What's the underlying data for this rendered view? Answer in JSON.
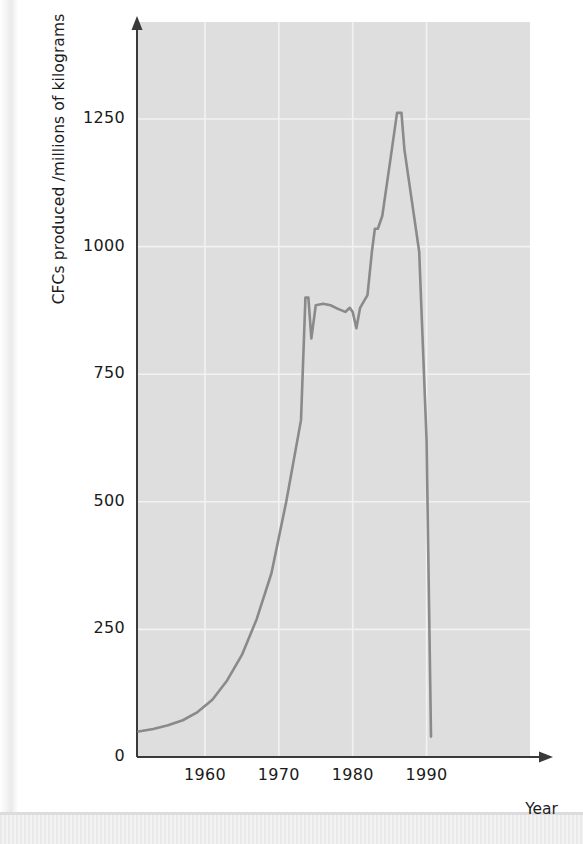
{
  "figure": {
    "background_color": "#ffffff",
    "plot_background_color": "#dededf",
    "gridline_color": "#f2f2f2",
    "line_color": "#8a8a8a",
    "axis_color": "#3a3a3a",
    "text_color": "#1a1a1a"
  },
  "axes": {
    "y_axis_label": "CFCs produced /millions of kilograms",
    "x_axis_label": "Year",
    "y_ticks": [
      "0",
      "250",
      "500",
      "750",
      "1000",
      "1250"
    ],
    "x_ticks": [
      "1960",
      "1970",
      "1980",
      "1990"
    ]
  },
  "chart_data": {
    "type": "line",
    "title": "",
    "xlabel": "Year",
    "ylabel": "CFCs produced /millions of kilograms",
    "xlim": [
      1950.8,
      2004.0
    ],
    "ylim": [
      0,
      1440
    ],
    "xtick_values": [
      1960,
      1970,
      1980,
      1990
    ],
    "ytick_values": [
      0,
      250,
      500,
      750,
      1000,
      1250
    ],
    "grid": true,
    "legend": "none",
    "series": [
      {
        "name": "CFCs produced",
        "units": "millions of kilograms",
        "x": [
          1951,
          1953,
          1955,
          1957,
          1959,
          1961,
          1963,
          1965,
          1967,
          1969,
          1971,
          1973,
          1973.6,
          1974,
          1974.4,
          1975,
          1976,
          1977,
          1978,
          1979,
          1979.6,
          1980,
          1980.5,
          1981,
          1982,
          1982.6,
          1983,
          1983.4,
          1984,
          1985,
          1986,
          1986.6,
          1987,
          1988,
          1989,
          1990,
          1990.6
        ],
        "y": [
          50,
          55,
          62,
          72,
          88,
          112,
          150,
          200,
          270,
          360,
          500,
          660,
          900,
          900,
          820,
          885,
          888,
          885,
          878,
          872,
          880,
          872,
          840,
          880,
          905,
          990,
          1035,
          1035,
          1060,
          1160,
          1262,
          1262,
          1190,
          1090,
          990,
          620,
          40
        ]
      }
    ],
    "annotations": [
      {
        "text": "sharp dip following 1974",
        "x": 1974.4,
        "y": 820
      },
      {
        "text": "plateau through the 1970s near 880",
        "x": 1977,
        "y": 885
      },
      {
        "text": "peak production",
        "x": 1986,
        "y": 1262
      },
      {
        "text": "steep decline after Montreal Protocol",
        "x": 1990,
        "y": 40
      }
    ]
  }
}
